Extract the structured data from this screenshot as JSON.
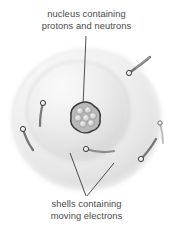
{
  "figure": {
    "background_color": "#ffffff",
    "text_color": "#4a4a4a"
  },
  "labels": {
    "top": {
      "name": "nucleus-label",
      "line1": "nucleus containing",
      "line2": "protons and neutrons"
    },
    "bottom": {
      "name": "shells-label",
      "line1": "shells containing",
      "line2": "moving electrons"
    }
  },
  "diagram": {
    "outer_shell": {
      "label": "outer-shell",
      "cx": 86,
      "cy": 119,
      "rx": 74,
      "ry": 70,
      "fill_light": "#fbfbfb",
      "fill_mid": "#ededed",
      "fill_edge": "#d9d9d9"
    },
    "inner_shell": {
      "label": "inner-shell",
      "cx": 78,
      "cy": 110,
      "rx": 52,
      "ry": 50,
      "fill_light": "#f7f7f7",
      "fill_mid": "#e4e4e4",
      "fill_edge": "#cfcfcf"
    },
    "nucleus": {
      "label": "nucleus",
      "cx": 86,
      "cy": 117,
      "rx": 14,
      "ry": 13,
      "outline_color": "#3a3a3a",
      "particle_count": 7,
      "particle_color": "#d4d4d4",
      "particles": [
        {
          "cx": 80,
          "cy": 111,
          "r": 3.4
        },
        {
          "cx": 88,
          "cy": 110,
          "r": 3.4
        },
        {
          "cx": 93,
          "cy": 116,
          "r": 3.4
        },
        {
          "cx": 86,
          "cy": 118,
          "r": 3.4
        },
        {
          "cx": 78,
          "cy": 118,
          "r": 3.4
        },
        {
          "cx": 83,
          "cy": 124,
          "r": 3.4
        },
        {
          "cx": 91,
          "cy": 123,
          "r": 3.4
        }
      ]
    },
    "electrons": [
      {
        "label": "electron-upper-right",
        "cx": 129,
        "cy": 73,
        "r": 2.6,
        "trail": "M129,73 C136,68 144,62 150,57"
      },
      {
        "label": "electron-left-upper",
        "cx": 43,
        "cy": 103,
        "r": 2.6,
        "trail": "M43,103 C41,110 40,118 40,125"
      },
      {
        "label": "electron-left-lower",
        "cx": 23,
        "cy": 129,
        "r": 2.6,
        "trail": "M23,129 C25,136 28,143 32,149"
      },
      {
        "label": "electron-center-lower",
        "cx": 86,
        "cy": 149,
        "r": 2.6,
        "trail": "M86,149 C95,151 105,152 114,151"
      },
      {
        "label": "electron-right-lower",
        "cx": 141,
        "cy": 159,
        "r": 2.6,
        "trail": "M141,159 C147,153 152,146 156,139"
      },
      {
        "label": "electron-far-right",
        "cx": 160,
        "cy": 123,
        "r": 2.2,
        "trail": "M160,123 C162,130 163,137 163,143"
      }
    ],
    "pointer_lines": [
      {
        "label": "pointer-to-nucleus",
        "x1": 86,
        "y1": 36,
        "x2": 83,
        "y2": 106
      },
      {
        "label": "pointer-to-inner-shell",
        "x1": 70,
        "y1": 153,
        "x2": 86,
        "y2": 196
      },
      {
        "label": "pointer-to-outer-shell",
        "x1": 114,
        "y1": 163,
        "x2": 87,
        "y2": 196
      }
    ],
    "line_color": "#3c3c3c"
  }
}
